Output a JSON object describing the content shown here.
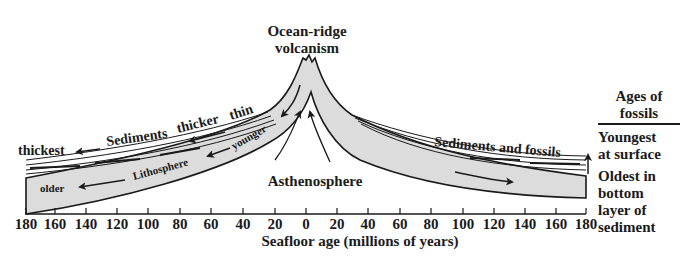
{
  "title_top": {
    "line1": "Ocean-ridge",
    "line2": "volcanism"
  },
  "labels": {
    "thickest": "thickest",
    "sediments": "Sediments",
    "thicker": "thicker",
    "thin": "thin",
    "younger": "younger",
    "lithosphere": "Lithosphere",
    "older": "older",
    "asthenosphere": "Asthenosphere",
    "sediments_and_fossils": "Sediments and fossils"
  },
  "side_panel": {
    "heading_line1": "Ages of",
    "heading_line2": "fossils",
    "youngest_line1": "Youngest",
    "youngest_line2": "at surface",
    "oldest_line1": "Oldest in",
    "oldest_line2": "bottom",
    "oldest_line3": "layer of",
    "oldest_line4": "sediment"
  },
  "axis": {
    "title": "Seafloor age (millions of years)",
    "ticks": [
      "180",
      "160",
      "140",
      "120",
      "100",
      "80",
      "60",
      "40",
      "20",
      "0",
      "20",
      "40",
      "60",
      "80",
      "100",
      "120",
      "140",
      "160",
      "180"
    ]
  },
  "colors": {
    "plate_fill": "#dcdcdc",
    "ink": "#1a1a1a",
    "background": "#ffffff"
  }
}
